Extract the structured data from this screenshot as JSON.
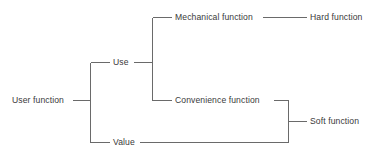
{
  "diagram": {
    "type": "tree",
    "orientation": "left-to-right",
    "canvas": {
      "width": 377,
      "height": 163
    },
    "style": {
      "background_color": "#ffffff",
      "line_color": "#6a6a6a",
      "line_width": 1,
      "text_color": "#3a3a3a",
      "font_size_px": 8.6
    },
    "nodes": [
      {
        "id": "user-function",
        "label": "User function",
        "level": 0,
        "x": 12,
        "y": 100
      },
      {
        "id": "use",
        "label": "Use",
        "level": 1,
        "x": 113,
        "y": 62
      },
      {
        "id": "value",
        "label": "Value",
        "level": 1,
        "x": 113,
        "y": 142
      },
      {
        "id": "mechanical-function",
        "label": "Mechanical function",
        "level": 2,
        "x": 175,
        "y": 17
      },
      {
        "id": "convenience-function",
        "label": "Convenience function",
        "level": 2,
        "x": 175,
        "y": 100
      },
      {
        "id": "hard-function",
        "label": "Hard function",
        "level": 3,
        "x": 310,
        "y": 17
      },
      {
        "id": "soft-function",
        "label": "Soft function",
        "level": 3,
        "x": 310,
        "y": 121
      }
    ],
    "edges": [
      {
        "from": "user-function",
        "to": "use"
      },
      {
        "from": "user-function",
        "to": "value"
      },
      {
        "from": "use",
        "to": "mechanical-function"
      },
      {
        "from": "use",
        "to": "convenience-function"
      },
      {
        "from": "mechanical-function",
        "to": "hard-function"
      },
      {
        "from": "convenience-function",
        "to": "soft-function"
      },
      {
        "from": "value",
        "to": "soft-function"
      }
    ]
  }
}
